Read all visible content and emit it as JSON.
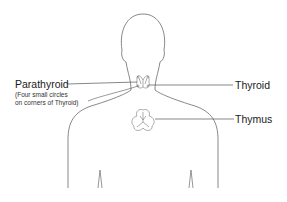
{
  "diagram": {
    "labels": {
      "parathyroid": "Parathyroid",
      "parathyroid_note_line1": "(Four small circles",
      "parathyroid_note_line2": "on corners of Thyroid)",
      "thyroid": "Thyroid",
      "thymus": "Thymus"
    },
    "colors": {
      "outline": "#6a6a6a",
      "leader_line": "#555555",
      "text": "#1a1a1a",
      "background": "#ffffff"
    }
  }
}
